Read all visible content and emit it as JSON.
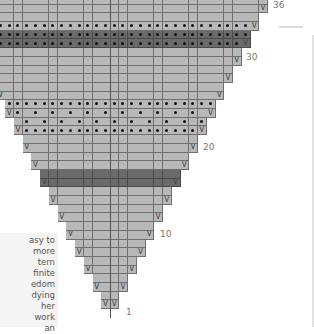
{
  "chart_data": {
    "type": "table",
    "rows_total": 36,
    "row_labels_shown": [
      1,
      10,
      20,
      30,
      36
    ],
    "cell_size_px": {
      "w": 8.75,
      "h": 8.7
    },
    "center_x": 110,
    "shape": "each pair of rows adds one stitch on each side; row 1 = 2 stitches",
    "legend": {
      "V": "increase (make one / yarn over)",
      "dot": "purl stitch",
      "dark": "contrast colour stripe",
      "light": "main colour"
    },
    "special_rows": [
      {
        "row": 15,
        "style": "dark",
        "dots": "none"
      },
      {
        "row": 16,
        "style": "dark",
        "dots": "none"
      },
      {
        "row": 21,
        "style": "light",
        "dots": "all"
      },
      {
        "row": 22,
        "style": "light",
        "dots": "alternate"
      },
      {
        "row": 23,
        "style": "light",
        "dots": "alternate"
      },
      {
        "row": 24,
        "style": "light",
        "dots": "all"
      },
      {
        "row": 31,
        "style": "dark",
        "dots": "all"
      },
      {
        "row": 32,
        "style": "dark",
        "dots": "all"
      },
      {
        "row": 33,
        "style": "light",
        "dots": "all"
      }
    ],
    "colors": {
      "light": "#b8b8b8",
      "dark": "#6a6a6a",
      "grid": "#6f6f6f"
    }
  },
  "labels": {
    "r1": "1",
    "r10": "10",
    "r20": "20",
    "r30": "30",
    "r36": "36"
  },
  "sidebox": {
    "lines": [
      "asy to",
      "more",
      "tern",
      "finite",
      "edom",
      "dying",
      "her",
      "work",
      "an",
      "cause"
    ]
  }
}
